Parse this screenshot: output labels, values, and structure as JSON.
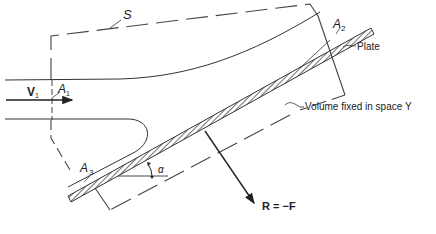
{
  "diagram": {
    "labels": {
      "surface": "S",
      "velocity": "V",
      "velocity_sub": "1",
      "area1": "A",
      "area1_sub": "1",
      "area2": "A",
      "area2_sub": "2",
      "area3": "A",
      "area3_sub": "3",
      "plate": "Plate",
      "volume": "Volume fixed in space Υ",
      "angle": "α",
      "force": "R = −F"
    },
    "colors": {
      "line": "#333333",
      "background": "#ffffff"
    }
  }
}
